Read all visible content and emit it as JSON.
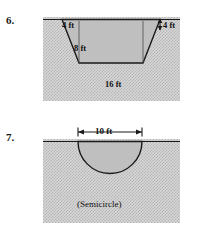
{
  "page": {
    "background": "#ffffff",
    "width": 198,
    "height": 234
  },
  "problems": [
    {
      "number": "6.",
      "figure_type": "trapezoid-channel-cross-section",
      "ground_fill": "#d8d8d8",
      "shape_fill": "#bfbfbf",
      "labels": {
        "top_left": "4 ft",
        "top_right": "4 ft",
        "depth": "8 ft",
        "bottom": "16 ft"
      }
    },
    {
      "number": "7.",
      "figure_type": "semicircle-channel-cross-section",
      "ground_fill": "#d8d8d8",
      "shape_fill": "#bfbfbf",
      "labels": {
        "width": "10 ft",
        "caption": "(Semicircle)"
      }
    }
  ]
}
